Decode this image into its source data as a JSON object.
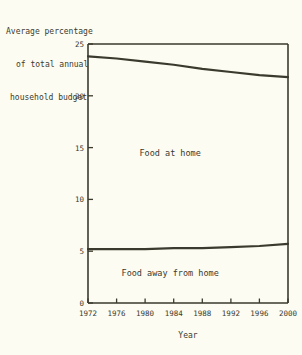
{
  "chart_data": {
    "type": "line",
    "title": "Average percentage of total annual household budget",
    "title_lines": [
      "Average percentage",
      "of total annual",
      "household budget"
    ],
    "xlabel": "Year",
    "ylabel": "Average percentage of total annual household budget",
    "x": [
      1972,
      1976,
      1980,
      1984,
      1988,
      1992,
      1996,
      2000
    ],
    "xtick_labels": [
      "1972",
      "1976",
      "1980",
      "1984",
      "1988",
      "1992",
      "1996",
      "2000"
    ],
    "ytick_labels": [
      "0",
      "5",
      "10",
      "15",
      "20",
      "25"
    ],
    "yticks": [
      0,
      5,
      10,
      15,
      20,
      25
    ],
    "xlim": [
      1972,
      2000
    ],
    "ylim": [
      0,
      25
    ],
    "grid": false,
    "legend": "inline-annotations",
    "series": [
      {
        "name": "Food at home",
        "label": "Food at home",
        "color": "#3a3a2e",
        "values": [
          23.8,
          23.6,
          23.3,
          23.0,
          22.6,
          22.3,
          22.0,
          21.8
        ]
      },
      {
        "name": "Food away from home",
        "label": "Food away from home",
        "color": "#3a3a2e",
        "values": [
          5.2,
          5.2,
          5.2,
          5.3,
          5.3,
          5.4,
          5.5,
          5.7
        ]
      }
    ],
    "annotations": [
      {
        "text": "Food at home",
        "x": 1983.5,
        "y": 14.2
      },
      {
        "text": "Food away from home",
        "x": 1983.5,
        "y": 2.6
      }
    ],
    "colors": {
      "background": "#fdfcf2",
      "line": "#3a3a2e",
      "axis": "#3a3a2e",
      "text": "#3a3a2e"
    }
  }
}
